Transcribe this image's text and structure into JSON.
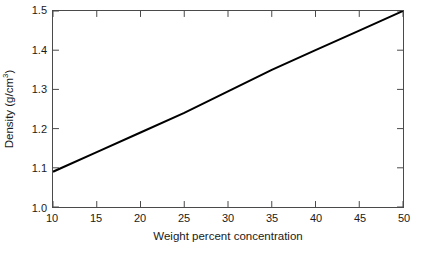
{
  "chart_data": {
    "type": "line",
    "title": "",
    "xlabel": "Weight percent concentration",
    "ylabel_text": "Density (g/cm",
    "ylabel_sup": "3",
    "ylabel_tail": ")",
    "ylabel_full": "Density (g/cm3)",
    "xlim": [
      10,
      50
    ],
    "ylim": [
      1.0,
      1.5
    ],
    "grid": false,
    "legend": null,
    "xticks": [
      10,
      15,
      20,
      25,
      30,
      35,
      40,
      45,
      50
    ],
    "xtick_labels": [
      "10",
      "15",
      "20",
      "25",
      "30",
      "35",
      "40",
      "45",
      "50"
    ],
    "yticks": [
      1.0,
      1.1,
      1.2,
      1.3,
      1.4,
      1.5
    ],
    "ytick_labels": [
      "1.0",
      "1.1",
      "1.2",
      "1.3",
      "1.4",
      "1.5"
    ],
    "series": [
      {
        "name": "density",
        "color": "#000000",
        "line_width": 2,
        "x": [
          10,
          15,
          20,
          25,
          30,
          35,
          40,
          45,
          50
        ],
        "values": [
          1.09,
          1.14,
          1.19,
          1.24,
          1.295,
          1.35,
          1.4,
          1.45,
          1.5
        ]
      }
    ]
  },
  "style": {
    "background": "#ffffff",
    "frame_color": "#4a4a4a",
    "tick_color": "#4a4a4a",
    "text_color": "#1a1a1a",
    "line_color": "#000000"
  }
}
